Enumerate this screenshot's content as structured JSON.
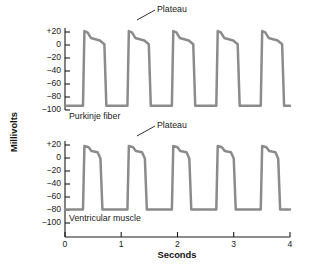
{
  "figure": {
    "axis_titles": {
      "y": "Millivolts",
      "x": "Seconds"
    },
    "y_ticks": [
      "+20",
      "0",
      "−20",
      "−40",
      "−60",
      "−80",
      "−100"
    ],
    "x_ticks": [
      "0",
      "1",
      "2",
      "3",
      "4"
    ],
    "trace_labels": {
      "top": "Purkinje fiber",
      "bottom": "Ventricular muscle"
    },
    "annotations": {
      "top_plateau": "Plateau",
      "bottom_plateau": "Plateau"
    },
    "colors": {
      "trace": "#8b8b8b",
      "axis": "#1a1a1a",
      "background": "#ffffff"
    }
  },
  "chart_data": {
    "type": "line",
    "title": "",
    "subtitle": "",
    "xlabel": "Seconds",
    "ylabel": "Millivolts",
    "xlim": [
      0,
      4
    ],
    "ylim": [
      -105,
      30
    ],
    "grid": false,
    "legend": "none",
    "x_ticks": [
      0,
      1,
      2,
      3,
      4
    ],
    "y_ticks": [
      20,
      0,
      -20,
      -40,
      -60,
      -80,
      -100
    ],
    "y_tick_labels": [
      "+20",
      "0",
      "-20",
      "-40",
      "-60",
      "-80",
      "-100"
    ],
    "annotations": [
      {
        "text": "Plateau",
        "panel": "Purkinje fiber",
        "points_to_x": 1.22,
        "points_to_mv": 12,
        "label_x": 1.55,
        "label_mv": 33
      },
      {
        "text": "Plateau",
        "panel": "Ventricular muscle",
        "points_to_x": 1.22,
        "points_to_mv": 12,
        "label_x": 1.55,
        "label_mv": 33
      }
    ],
    "series": [
      {
        "name": "Purkinje fiber",
        "resting_mv": -95,
        "peak_mv": 25,
        "plateau_mv": 10,
        "plateau_duration_s": 0.38,
        "beats": 5,
        "beat_period_s": 0.79,
        "first_upstroke_s": 0.33,
        "description": "Fast upstroke to +25 mV, brief notch, long slowly-declining plateau near +10 mV, then rapid repolarization to a resting potential of about -95 mV.",
        "points_mv_vs_s": [
          [
            0.0,
            -95
          ],
          [
            0.32,
            -95
          ],
          [
            0.345,
            25
          ],
          [
            0.4,
            23
          ],
          [
            0.46,
            14
          ],
          [
            0.62,
            10
          ],
          [
            0.7,
            4
          ],
          [
            0.735,
            -95
          ],
          [
            1.11,
            -95
          ],
          [
            1.135,
            25
          ],
          [
            1.19,
            23
          ],
          [
            1.25,
            14
          ],
          [
            1.41,
            10
          ],
          [
            1.49,
            4
          ],
          [
            1.525,
            -95
          ],
          [
            1.9,
            -95
          ],
          [
            1.925,
            25
          ],
          [
            1.98,
            23
          ],
          [
            2.04,
            14
          ],
          [
            2.2,
            10
          ],
          [
            2.28,
            4
          ],
          [
            2.315,
            -95
          ],
          [
            2.69,
            -95
          ],
          [
            2.715,
            25
          ],
          [
            2.77,
            23
          ],
          [
            2.83,
            14
          ],
          [
            2.99,
            10
          ],
          [
            3.07,
            4
          ],
          [
            3.105,
            -95
          ],
          [
            3.48,
            -95
          ],
          [
            3.505,
            25
          ],
          [
            3.56,
            23
          ],
          [
            3.62,
            14
          ],
          [
            3.78,
            10
          ],
          [
            3.86,
            4
          ],
          [
            3.895,
            -95
          ],
          [
            4.0,
            -95
          ]
        ]
      },
      {
        "name": "Ventricular muscle",
        "resting_mv": -80,
        "peak_mv": 22,
        "plateau_mv": 12,
        "plateau_duration_s": 0.24,
        "beats": 5,
        "beat_period_s": 0.79,
        "first_upstroke_s": 0.33,
        "description": "Fast upstroke to about +22 mV, flat plateau near +12 mV of shorter duration than the Purkinje fiber, then rapid repolarization to a resting potential of about -80 mV.",
        "points_mv_vs_s": [
          [
            0.0,
            -80
          ],
          [
            0.32,
            -80
          ],
          [
            0.345,
            22
          ],
          [
            0.42,
            20
          ],
          [
            0.47,
            14
          ],
          [
            0.58,
            12
          ],
          [
            0.63,
            2
          ],
          [
            0.665,
            -80
          ],
          [
            1.11,
            -80
          ],
          [
            1.135,
            22
          ],
          [
            1.21,
            20
          ],
          [
            1.26,
            14
          ],
          [
            1.37,
            12
          ],
          [
            1.42,
            2
          ],
          [
            1.455,
            -80
          ],
          [
            1.9,
            -80
          ],
          [
            1.925,
            22
          ],
          [
            2.0,
            20
          ],
          [
            2.05,
            14
          ],
          [
            2.16,
            12
          ],
          [
            2.21,
            2
          ],
          [
            2.245,
            -80
          ],
          [
            2.69,
            -80
          ],
          [
            2.715,
            22
          ],
          [
            2.79,
            20
          ],
          [
            2.84,
            14
          ],
          [
            2.95,
            12
          ],
          [
            3.0,
            2
          ],
          [
            3.035,
            -80
          ],
          [
            3.48,
            -80
          ],
          [
            3.505,
            22
          ],
          [
            3.58,
            20
          ],
          [
            3.63,
            14
          ],
          [
            3.74,
            12
          ],
          [
            3.79,
            2
          ],
          [
            3.825,
            -80
          ],
          [
            4.0,
            -80
          ]
        ]
      }
    ]
  }
}
